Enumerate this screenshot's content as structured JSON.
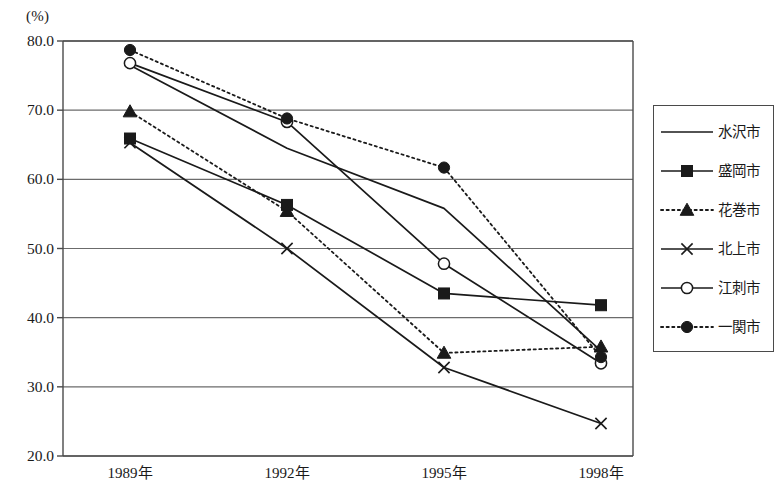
{
  "chart_data": {
    "type": "line",
    "title": "",
    "subtitle": "",
    "xlabel": "",
    "ylabel": "(%)",
    "unit_label": "(%)",
    "categories": [
      "1989年",
      "1992年",
      "1995年",
      "1998年"
    ],
    "ylim": [
      20.0,
      80.0
    ],
    "ytick_labels": [
      "80.0",
      "70.0",
      "60.0",
      "50.0",
      "40.0",
      "30.0",
      "20.0"
    ],
    "ytick_values": [
      80.0,
      70.0,
      60.0,
      50.0,
      40.0,
      30.0,
      20.0
    ],
    "grid": true,
    "legend_position": "right",
    "series": [
      {
        "name": "水沢市",
        "values": [
          76.5,
          64.5,
          55.8,
          35.2
        ],
        "line_style": "solid",
        "marker": "none",
        "color": "#1a1a1a"
      },
      {
        "name": "盛岡市",
        "values": [
          65.9,
          56.3,
          43.5,
          41.8
        ],
        "line_style": "solid",
        "marker": "square-filled",
        "color": "#1a1a1a"
      },
      {
        "name": "花巻市",
        "values": [
          69.8,
          55.4,
          34.9,
          35.8
        ],
        "line_style": "dotted",
        "marker": "triangle-filled",
        "color": "#1a1a1a"
      },
      {
        "name": "北上市",
        "values": [
          65.3,
          50.0,
          32.8,
          24.7
        ],
        "line_style": "solid",
        "marker": "cross-x",
        "color": "#1a1a1a"
      },
      {
        "name": "江刺市",
        "values": [
          76.8,
          68.3,
          47.8,
          33.4
        ],
        "line_style": "solid",
        "marker": "circle-open",
        "color": "#1a1a1a"
      },
      {
        "name": "一関市",
        "values": [
          78.7,
          68.8,
          61.7,
          34.3
        ],
        "line_style": "dotted",
        "marker": "circle-filled",
        "color": "#1a1a1a"
      }
    ]
  },
  "legend": {
    "entries": [
      {
        "label": "水沢市"
      },
      {
        "label": "盛岡市"
      },
      {
        "label": "花巻市"
      },
      {
        "label": "北上市"
      },
      {
        "label": "江刺市"
      },
      {
        "label": "一関市"
      }
    ]
  },
  "colors": {
    "ink": "#1a1a1a",
    "axis": "#4a4a4a",
    "grid": "#6b6b6b",
    "background": "#ffffff"
  }
}
